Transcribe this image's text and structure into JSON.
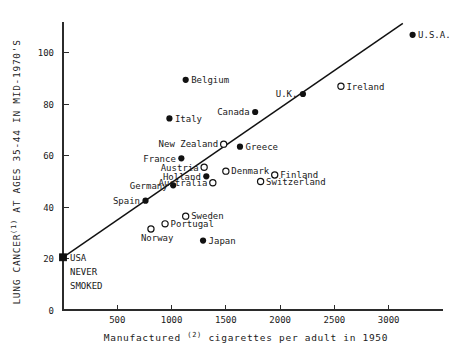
{
  "chart_data": {
    "type": "scatter",
    "title": "",
    "xlabel": "Manufactured (2) cigarettes per adult in 1950",
    "xlabel_parts": {
      "lead": "Manufactured",
      "superscript": "(2)",
      "tail": "cigarettes per adult in 1950"
    },
    "ylabel": "LUNG CANCER (1) AT AGES 35-44 IN MID-1970'S",
    "ylabel_parts": {
      "lead": "LUNG CANCER",
      "superscript": "(1)",
      "tail": "AT AGES 35-44 IN MID-1970'S"
    },
    "xlim": [
      0,
      3500
    ],
    "ylim": [
      0,
      112
    ],
    "grid": false,
    "legend": "none",
    "xticks": [
      500,
      1000,
      1500,
      2000,
      2500,
      3000
    ],
    "xtick_labels": [
      "500",
      "1000",
      "1500",
      "2000",
      "2500",
      "3000"
    ],
    "yticks": [
      0,
      20,
      40,
      60,
      80,
      100
    ],
    "ytick_labels": [
      "0",
      "20",
      "40",
      "60",
      "80",
      "100"
    ],
    "fit_line": {
      "x0": 0,
      "y0": 20.5,
      "x1": 3130,
      "y1": 111.5
    },
    "points": [
      {
        "label": "U.S.A.",
        "x": 3220,
        "y": 107.0,
        "marker": "filled",
        "label_pos": "right"
      },
      {
        "label": "Ireland",
        "x": 2560,
        "y": 87.0,
        "marker": "open",
        "label_pos": "right"
      },
      {
        "label": "Belgium",
        "x": 1130,
        "y": 89.5,
        "marker": "filled",
        "label_pos": "right"
      },
      {
        "label": "U.K.",
        "x": 2210,
        "y": 84.0,
        "marker": "filled",
        "label_pos": "left"
      },
      {
        "label": "Canada",
        "x": 1770,
        "y": 77.0,
        "marker": "filled",
        "label_pos": "left"
      },
      {
        "label": "Italy",
        "x": 980,
        "y": 74.5,
        "marker": "filled",
        "label_pos": "right"
      },
      {
        "label": "New Zealand",
        "x": 1480,
        "y": 64.5,
        "marker": "open",
        "label_pos": "left"
      },
      {
        "label": "Greece",
        "x": 1630,
        "y": 63.5,
        "marker": "filled",
        "label_pos": "right"
      },
      {
        "label": "France",
        "x": 1090,
        "y": 59.0,
        "marker": "filled",
        "label_pos": "left"
      },
      {
        "label": "Austria",
        "x": 1300,
        "y": 55.5,
        "marker": "open",
        "label_pos": "left"
      },
      {
        "label": "Denmark",
        "x": 1500,
        "y": 54.0,
        "marker": "open",
        "label_pos": "right"
      },
      {
        "label": "Holland",
        "x": 1320,
        "y": 52.0,
        "marker": "filled",
        "label_pos": "left"
      },
      {
        "label": "Finland",
        "x": 1950,
        "y": 52.5,
        "marker": "open",
        "label_pos": "right"
      },
      {
        "label": "Switzerland",
        "x": 1820,
        "y": 50.0,
        "marker": "open",
        "label_pos": "right"
      },
      {
        "label": "Australia",
        "x": 1380,
        "y": 49.5,
        "marker": "open",
        "label_pos": "left"
      },
      {
        "label": "Germany",
        "x": 1015,
        "y": 48.5,
        "marker": "filled",
        "label_pos": "left"
      },
      {
        "label": "Spain",
        "x": 760,
        "y": 42.5,
        "marker": "filled",
        "label_pos": "left"
      },
      {
        "label": "Sweden",
        "x": 1130,
        "y": 36.5,
        "marker": "open",
        "label_pos": "right"
      },
      {
        "label": "Portugal",
        "x": 940,
        "y": 33.5,
        "marker": "open",
        "label_pos": "right"
      },
      {
        "label": "Norway",
        "x": 810,
        "y": 31.5,
        "marker": "open",
        "label_pos": "below"
      },
      {
        "label": "Japan",
        "x": 1290,
        "y": 27.0,
        "marker": "filled",
        "label_pos": "right"
      }
    ],
    "reference_point": {
      "label_lines": [
        "USA",
        "NEVER",
        "SMOKED"
      ],
      "x": 0,
      "y": 20.5,
      "marker": "square"
    }
  }
}
